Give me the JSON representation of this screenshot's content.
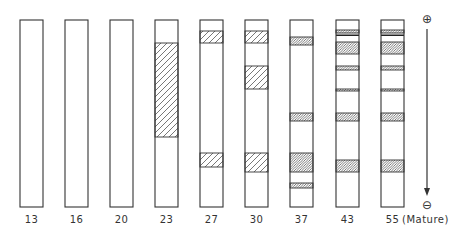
{
  "figure": {
    "type": "electrophoresis-gel-schematic",
    "column_top": 20,
    "column_bottom": 207,
    "column_width": 23,
    "stroke_color": "#333333",
    "hatch_color": "#444444",
    "lanes": [
      {
        "label": "13",
        "x": 20,
        "bands": []
      },
      {
        "label": "16",
        "x": 65,
        "bands": []
      },
      {
        "label": "20",
        "x": 110,
        "bands": []
      },
      {
        "label": "23",
        "x": 155,
        "bands": [
          {
            "y1": 43,
            "y2": 137,
            "pattern": "coarse"
          }
        ]
      },
      {
        "label": "27",
        "x": 200,
        "bands": [
          {
            "y1": 31,
            "y2": 43,
            "pattern": "coarse"
          },
          {
            "y1": 153,
            "y2": 167,
            "pattern": "coarse"
          }
        ]
      },
      {
        "label": "30",
        "x": 245,
        "bands": [
          {
            "y1": 31,
            "y2": 43,
            "pattern": "coarse"
          },
          {
            "y1": 66,
            "y2": 89,
            "pattern": "coarse"
          },
          {
            "y1": 153,
            "y2": 172,
            "pattern": "coarse"
          }
        ]
      },
      {
        "label": "37",
        "x": 290,
        "bands": [
          {
            "y1": 37,
            "y2": 45,
            "pattern": "fine"
          },
          {
            "y1": 113,
            "y2": 121,
            "pattern": "fine"
          },
          {
            "y1": 153,
            "y2": 172,
            "pattern": "fine"
          },
          {
            "y1": 183,
            "y2": 188,
            "pattern": "fine"
          }
        ]
      },
      {
        "label": "43",
        "x": 336,
        "bands": [
          {
            "y1": 30,
            "y2": 33,
            "pattern": "fine"
          },
          {
            "y1": 34.5,
            "y2": 36,
            "pattern": "solid"
          },
          {
            "y1": 42,
            "y2": 54,
            "pattern": "fine"
          },
          {
            "y1": 66,
            "y2": 70,
            "pattern": "fine"
          },
          {
            "y1": 89,
            "y2": 91,
            "pattern": "fine"
          },
          {
            "y1": 113,
            "y2": 121,
            "pattern": "fine"
          },
          {
            "y1": 160,
            "y2": 172,
            "pattern": "fine"
          }
        ]
      },
      {
        "label": "55",
        "x": 381,
        "bands": [
          {
            "y1": 30,
            "y2": 33,
            "pattern": "fine"
          },
          {
            "y1": 34.5,
            "y2": 36,
            "pattern": "solid"
          },
          {
            "y1": 42,
            "y2": 54,
            "pattern": "fine"
          },
          {
            "y1": 66,
            "y2": 70,
            "pattern": "fine"
          },
          {
            "y1": 89,
            "y2": 91,
            "pattern": "fine"
          },
          {
            "y1": 113,
            "y2": 121,
            "pattern": "fine"
          },
          {
            "y1": 160,
            "y2": 172,
            "pattern": "fine"
          }
        ]
      }
    ],
    "mature_label": "(Mature)",
    "direction": {
      "positive_symbol": "⊕",
      "negative_symbol": "⊖",
      "arrow_x": 427,
      "arrow_y1": 29,
      "arrow_y2": 196
    }
  }
}
